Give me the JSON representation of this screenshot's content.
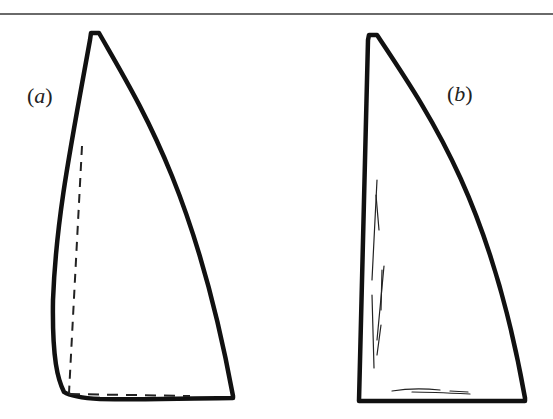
{
  "figure": {
    "panels": [
      {
        "id": "a",
        "label_open": "(",
        "label_letter": "a",
        "label_close": ")",
        "description": "Sail outline with curved luff and foot; dashed straight reference lines along luff and foot"
      },
      {
        "id": "b",
        "label_open": "(",
        "label_letter": "b",
        "label_close": ")",
        "description": "Sail outline with straight luff; thin crease lines near luff and foot"
      }
    ],
    "colors": {
      "outline": "#111111",
      "rule": "#6a6a6a",
      "background": "#ffffff"
    }
  }
}
